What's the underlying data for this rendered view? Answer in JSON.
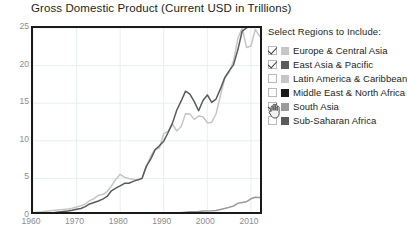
{
  "chart_data": {
    "type": "line",
    "title": "Gross Domestic Product (Current USD in Trillions)",
    "xlabel": "",
    "ylabel": "",
    "xlim": [
      1960,
      2013
    ],
    "ylim": [
      0,
      25
    ],
    "grid": true,
    "legend_position": "right",
    "y_ticks": [
      "25",
      "20",
      "15",
      "10",
      "5",
      "0"
    ],
    "y_tick_values": [
      25,
      20,
      15,
      10,
      5,
      0
    ],
    "x_ticks": [
      "1960",
      "1970",
      "1980",
      "1990",
      "2000",
      "2010"
    ],
    "x_tick_values": [
      1960,
      1970,
      1980,
      1990,
      2000,
      2010
    ],
    "x": [
      1960,
      1961,
      1962,
      1963,
      1964,
      1965,
      1966,
      1967,
      1968,
      1969,
      1970,
      1971,
      1972,
      1973,
      1974,
      1975,
      1976,
      1977,
      1978,
      1979,
      1980,
      1981,
      1982,
      1983,
      1984,
      1985,
      1986,
      1987,
      1988,
      1989,
      1990,
      1991,
      1992,
      1993,
      1994,
      1995,
      1996,
      1997,
      1998,
      1999,
      2000,
      2001,
      2002,
      2003,
      2004,
      2005,
      2006,
      2007,
      2008,
      2009,
      2010,
      2011,
      2012,
      2013
    ],
    "series": [
      {
        "name": "Europe & Central Asia",
        "color": "#c6c6c6",
        "visible": true,
        "values": [
          0.45,
          0.5,
          0.55,
          0.62,
          0.7,
          0.76,
          0.83,
          0.88,
          0.92,
          1.03,
          1.2,
          1.35,
          1.6,
          2.05,
          2.3,
          2.75,
          2.85,
          3.25,
          4.0,
          4.85,
          5.55,
          5.15,
          5.0,
          4.9,
          4.75,
          4.95,
          6.6,
          7.95,
          8.85,
          9.05,
          10.95,
          11.25,
          12.2,
          11.3,
          11.9,
          13.6,
          13.55,
          12.85,
          13.3,
          13.2,
          12.4,
          12.45,
          13.6,
          16.0,
          18.3,
          19.1,
          20.6,
          23.6,
          25.0,
          22.4,
          22.6,
          24.8,
          23.9,
          24.5
        ]
      },
      {
        "name": "East Asia & Pacific",
        "color": "#5a5a5a",
        "visible": true,
        "values": [
          0.28,
          0.31,
          0.34,
          0.38,
          0.43,
          0.47,
          0.53,
          0.59,
          0.66,
          0.77,
          0.9,
          1.0,
          1.25,
          1.6,
          1.8,
          2.0,
          2.25,
          2.6,
          3.35,
          3.7,
          4.0,
          4.35,
          4.35,
          4.6,
          4.8,
          5.0,
          6.6,
          7.55,
          8.8,
          9.35,
          9.95,
          11.1,
          12.35,
          14.1,
          15.3,
          16.6,
          16.2,
          15.2,
          14.0,
          15.35,
          16.1,
          15.1,
          15.55,
          16.9,
          18.4,
          19.3,
          20.1,
          22.1,
          24.6,
          25.0,
          26.5,
          29.0,
          30.5,
          31.5
        ]
      },
      {
        "name": "South Asia",
        "color": "#9a9a9a",
        "visible": true,
        "values": [
          0.04,
          0.04,
          0.04,
          0.05,
          0.06,
          0.06,
          0.06,
          0.07,
          0.07,
          0.08,
          0.08,
          0.09,
          0.09,
          0.11,
          0.13,
          0.14,
          0.14,
          0.16,
          0.18,
          0.2,
          0.23,
          0.25,
          0.26,
          0.28,
          0.29,
          0.32,
          0.33,
          0.37,
          0.4,
          0.41,
          0.44,
          0.39,
          0.38,
          0.38,
          0.44,
          0.5,
          0.55,
          0.58,
          0.6,
          0.65,
          0.67,
          0.69,
          0.74,
          0.87,
          1.01,
          1.16,
          1.33,
          1.69,
          1.79,
          1.9,
          2.29,
          2.5,
          2.45,
          2.55
        ]
      }
    ],
    "hidden_series": [
      {
        "name": "Latin America & Caribbean",
        "color": "#c6c6c6",
        "visible": false
      },
      {
        "name": "Middle East & North Africa",
        "color": "#1a1a1a",
        "visible": false
      },
      {
        "name": "Sub-Saharan Africa",
        "color": "#5a5a5a",
        "visible": false
      }
    ]
  },
  "legend": {
    "heading": "Select Regions to Include:",
    "items": [
      {
        "label": "Europe & Central Asia",
        "checked": true,
        "color": "#c6c6c6"
      },
      {
        "label": "East Asia & Pacific",
        "checked": true,
        "color": "#5a5a5a"
      },
      {
        "label": "Latin America & Caribbean",
        "checked": false,
        "color": "#c6c6c6"
      },
      {
        "label": "Middle East & North Africa",
        "checked": false,
        "color": "#1a1a1a"
      },
      {
        "label": "South Asia",
        "checked": true,
        "color": "#9a9a9a"
      },
      {
        "label": "Sub-Saharan Africa",
        "checked": false,
        "color": "#5a5a5a"
      }
    ]
  },
  "caption": {
    "text": ""
  },
  "colors": {
    "axis": "#1a1a1a",
    "grid": "#e8eef2",
    "tick_label": "#8c8c8c",
    "text": "#231f20",
    "background": "#ffffff"
  }
}
